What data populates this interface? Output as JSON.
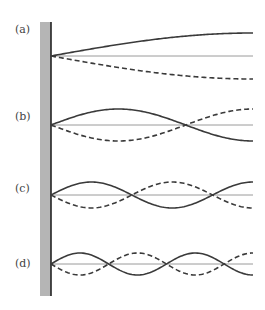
{
  "figure": {
    "wall": {
      "x": 40,
      "width": 11,
      "top": 22,
      "bottom": 296,
      "fill": "#b5b5b5",
      "edge": "#222222"
    },
    "string_end_x": 253,
    "colors": {
      "solid": "#3a3a3a",
      "dashed": "#3a3a3a",
      "axis": "#9a9a9a"
    },
    "panels": [
      {
        "label": "(a)",
        "label_y": 34,
        "axis_y": 56,
        "amplitude": 23,
        "quarter_waves": 1
      },
      {
        "label": "(b)",
        "label_y": 121,
        "axis_y": 125,
        "amplitude": 16,
        "quarter_waves": 3
      },
      {
        "label": "(c)",
        "label_y": 193,
        "axis_y": 195,
        "amplitude": 13,
        "quarter_waves": 5
      },
      {
        "label": "(d)",
        "label_y": 268,
        "axis_y": 264,
        "amplitude": 11,
        "quarter_waves": 7
      }
    ]
  }
}
